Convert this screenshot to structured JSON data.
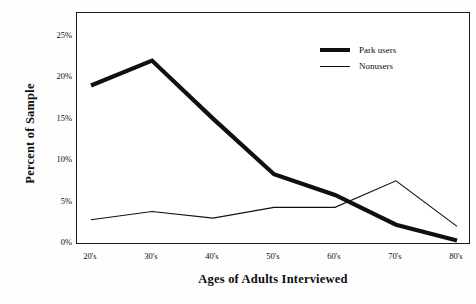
{
  "chart_data": {
    "type": "line",
    "title": "",
    "xlabel": "Ages of Adults Interviewed",
    "ylabel": "Percent of Sample",
    "categories": [
      "20's",
      "30's",
      "40's",
      "50's",
      "60's",
      "70's",
      "80's"
    ],
    "series": [
      {
        "name": "Park users",
        "values": [
          19.0,
          22.0,
          15.0,
          8.3,
          5.8,
          2.2,
          0.3
        ],
        "style": "thick",
        "color": "#101010"
      },
      {
        "name": "Nonusers",
        "values": [
          2.8,
          3.8,
          3.0,
          4.3,
          4.3,
          7.5,
          2.0
        ],
        "style": "thin",
        "color": "#101010"
      }
    ],
    "ylim": [
      0,
      27.5
    ],
    "yticks": [
      "0%",
      "5%",
      "10%",
      "15%",
      "20%",
      "25%"
    ],
    "ytick_values": [
      0,
      5,
      10,
      15,
      20,
      25
    ],
    "grid": false,
    "legend_position": "top-right",
    "frame": true
  }
}
